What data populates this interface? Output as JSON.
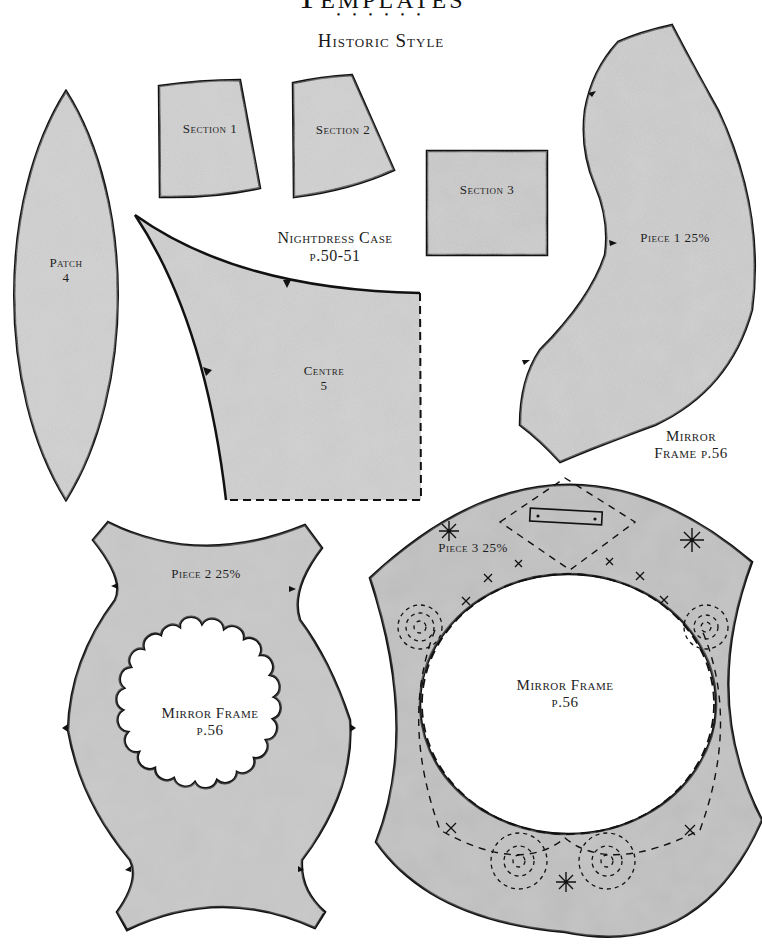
{
  "header": {
    "title": "Templates",
    "divider": "• • • • • •",
    "subtitle": "Historic Style"
  },
  "colors": {
    "fabric": "#c4c4c4",
    "fabric_dark": "#a9a9a9",
    "outline": "#111111",
    "background": "#ffffff"
  },
  "pieces": {
    "patch": {
      "name": "Patch",
      "number": "4"
    },
    "section1": {
      "name": "Section 1"
    },
    "section2": {
      "name": "Section 2"
    },
    "section3": {
      "name": "Section 3"
    },
    "centre": {
      "name": "Centre",
      "number": "5"
    },
    "nightdress": {
      "project": "Nightdress Case",
      "page": "p.50-51"
    },
    "piece1": {
      "name": "Piece 1 25%"
    },
    "mirror_label_right": {
      "line1": "Mirror",
      "line2": "Frame p.56"
    },
    "piece2": {
      "name": "Piece 2 25%",
      "project": "Mirror Frame",
      "page": "p.56"
    },
    "piece3": {
      "name": "Piece 3 25%",
      "project": "Mirror Frame",
      "page": "p.56"
    }
  }
}
